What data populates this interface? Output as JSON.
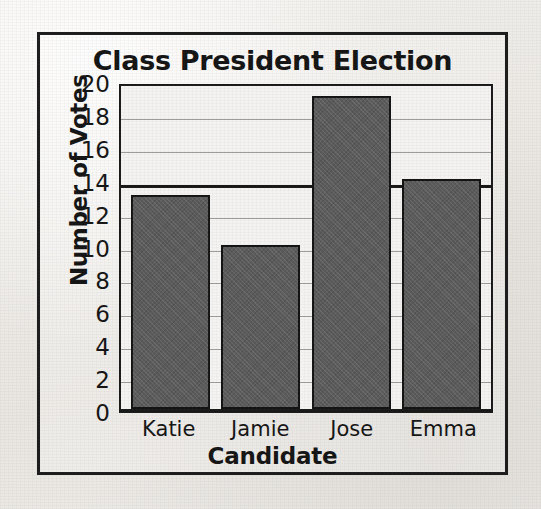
{
  "figure": {
    "frame_color": "#1c1c1c",
    "background_color": "#f2f1ef"
  },
  "chart_data": {
    "type": "bar",
    "title": "Class President Election",
    "xlabel": "Candidate",
    "ylabel": "Number of Votes",
    "categories": [
      "Katie",
      "Jamie",
      "Jose",
      "Emma"
    ],
    "values": [
      13,
      10,
      19,
      14
    ],
    "ylim": [
      0,
      20
    ],
    "ytick_step": 2,
    "yticks": [
      20,
      18,
      16,
      14,
      12,
      10,
      8,
      6,
      4,
      2,
      0
    ],
    "ytick_labels": [
      "20",
      "18",
      "16",
      "14",
      "12",
      "10",
      "8",
      "6",
      "4",
      "2",
      "0"
    ],
    "grid": true,
    "grid_axis": "y",
    "emphasized_gridline": 14,
    "legend": null,
    "legend_position": "none",
    "bar_color": "#5b5b5b",
    "bar_edge_color": "#131313",
    "gridline_color": "#9c9c9c",
    "plot_background": "#f4f3f1",
    "axis_color": "#181818"
  }
}
